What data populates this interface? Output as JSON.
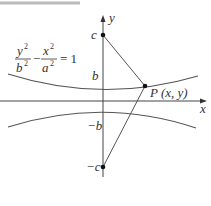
{
  "diagram": {
    "equation": {
      "numerator_left": "y",
      "denominator_left": "b",
      "minus": "−",
      "numerator_right": "x",
      "denominator_right": "a",
      "exponent": "2",
      "equals": "= 1"
    },
    "axis_labels": {
      "x": "x",
      "y": "y"
    },
    "point_labels": {
      "c": "c",
      "b": "b",
      "neg_b": "−b",
      "neg_c": "−c",
      "P": "P (x, y)"
    },
    "colors": {
      "axis": "#444444",
      "curve": "#555555",
      "line": "#555555",
      "point": "#111111",
      "top_rule": "#aaaaaa"
    }
  }
}
